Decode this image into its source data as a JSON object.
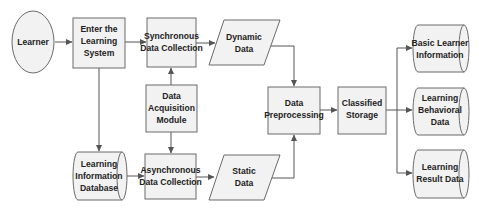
{
  "diagram": {
    "colors": {
      "fill": "#f2f2f2",
      "stroke": "#6b6b6b",
      "arrow": "#555555",
      "text": "#222222",
      "background": "#ffffff"
    },
    "nodes": {
      "learner": {
        "shape": "ellipse",
        "lines": [
          "Learner"
        ]
      },
      "enter_system": {
        "shape": "rectangle",
        "lines": [
          "Enter the",
          "Learning",
          "System"
        ]
      },
      "sync_collection": {
        "shape": "rectangle",
        "lines": [
          "Synchronous",
          "Data Collection"
        ]
      },
      "dynamic_data": {
        "shape": "parallelogram",
        "lines": [
          "Dynamic",
          "Data"
        ]
      },
      "acquisition_module": {
        "shape": "rectangle",
        "lines": [
          "Data",
          "Acquisition",
          "Module"
        ]
      },
      "learning_info_db": {
        "shape": "cylinder",
        "lines": [
          "Learning",
          "Information",
          "Database"
        ]
      },
      "async_collection": {
        "shape": "rectangle",
        "lines": [
          "Asynchronous",
          "Data Collection"
        ]
      },
      "static_data": {
        "shape": "parallelogram",
        "lines": [
          "Static",
          "Data"
        ]
      },
      "preprocessing": {
        "shape": "rectangle",
        "lines": [
          "Data",
          "Preprocessing"
        ]
      },
      "classified_storage": {
        "shape": "rectangle",
        "lines": [
          "Classified",
          "Storage"
        ]
      },
      "basic_info": {
        "shape": "cylinder",
        "lines": [
          "Basic Learner",
          "Information"
        ]
      },
      "behavioral_data": {
        "shape": "cylinder",
        "lines": [
          "Learning",
          "Behavioral",
          "Data"
        ]
      },
      "result_data": {
        "shape": "cylinder",
        "lines": [
          "Learning",
          "Result Data"
        ]
      }
    },
    "edges": [
      {
        "from": "learner",
        "to": "enter_system"
      },
      {
        "from": "enter_system",
        "to": "sync_collection"
      },
      {
        "from": "enter_system",
        "to": "learning_info_db"
      },
      {
        "from": "sync_collection",
        "to": "dynamic_data"
      },
      {
        "from": "acquisition_module",
        "to": "sync_collection"
      },
      {
        "from": "acquisition_module",
        "to": "async_collection"
      },
      {
        "from": "learning_info_db",
        "to": "async_collection"
      },
      {
        "from": "async_collection",
        "to": "static_data"
      },
      {
        "from": "dynamic_data",
        "to": "preprocessing"
      },
      {
        "from": "static_data",
        "to": "preprocessing"
      },
      {
        "from": "preprocessing",
        "to": "classified_storage"
      },
      {
        "from": "classified_storage",
        "to": "basic_info"
      },
      {
        "from": "classified_storage",
        "to": "behavioral_data"
      },
      {
        "from": "classified_storage",
        "to": "result_data"
      }
    ]
  }
}
